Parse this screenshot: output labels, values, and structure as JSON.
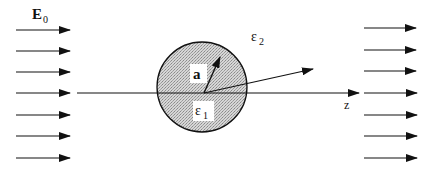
{
  "diagram": {
    "title_label": "E",
    "title_subscript": "0",
    "sphere_radius_label": "a",
    "inner_permittivity": "ε",
    "inner_permittivity_sub": "1",
    "outer_permittivity": "ε",
    "outer_permittivity_sub": "2",
    "axis_label": "z",
    "incident_field_arrow_rows": 7,
    "transmitted_field_arrow_rows": 7,
    "colors": {
      "line": "#111111",
      "sphere_fill": "#bdbdbd",
      "label_box": "#ffffff"
    }
  }
}
